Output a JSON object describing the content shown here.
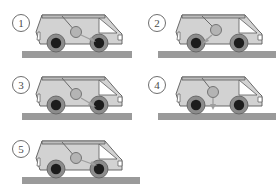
{
  "figure": {
    "background_color": "#ffffff",
    "colors": {
      "body_fill": "#d2d2d2",
      "body_stroke": "#5a5a5a",
      "roof_fill": "#bdbdbd",
      "window_fill": "#ffffff",
      "tire_fill": "#1c1c1c",
      "rim_fill": "#8c8c8c",
      "ground_fill": "#9a9a9a",
      "bob_fill": "#b4b4b4",
      "bob_stroke": "#6a6a6a",
      "string_stroke": "#6a6a6a",
      "arrow_stroke": "#9e9e9e",
      "label_text": "#4a4a4a",
      "label_border": "#6e6e6e"
    }
  },
  "panels": [
    {
      "id": "panel-1",
      "label": "1",
      "icon_name": "circled-number-1",
      "pendulum": {
        "pivot_x": 62,
        "pivot_y": 13,
        "bob_x": 76,
        "bob_y": 30,
        "bob_r": 5.5,
        "tilt": "backward"
      },
      "arrow": {
        "name": "acceleration-arrow-right-down",
        "from_x": 80,
        "from_y": 33,
        "to_x": 95,
        "to_y": 40,
        "direction": "down-right"
      }
    },
    {
      "id": "panel-2",
      "label": "2",
      "icon_name": "circled-number-2",
      "pendulum": {
        "pivot_x": 62,
        "pivot_y": 13,
        "bob_x": 76,
        "bob_y": 28,
        "bob_r": 5.5,
        "tilt": "backward"
      },
      "arrow": {
        "name": "acceleration-arrow-left-down",
        "from_x": 72,
        "from_y": 33,
        "to_x": 62,
        "to_y": 42,
        "direction": "down-left"
      }
    },
    {
      "id": "panel-3",
      "label": "3",
      "icon_name": "circled-number-3",
      "pendulum": {
        "pivot_x": 62,
        "pivot_y": 13,
        "bob_x": 76,
        "bob_y": 30,
        "bob_r": 5.5,
        "tilt": "backward"
      },
      "arrow": {
        "name": "acceleration-arrow-right-down",
        "from_x": 80,
        "from_y": 33,
        "to_x": 95,
        "to_y": 42,
        "direction": "down-right"
      }
    },
    {
      "id": "panel-4",
      "label": "4",
      "icon_name": "circled-number-4",
      "pendulum": {
        "pivot_x": 62,
        "pivot_y": 13,
        "bob_x": 73,
        "bob_y": 28,
        "bob_r": 5.5,
        "tilt": "backward"
      },
      "arrow": {
        "name": "acceleration-arrow-down",
        "from_x": 73,
        "from_y": 34,
        "to_x": 73,
        "to_y": 45,
        "direction": "down"
      }
    },
    {
      "id": "panel-5",
      "label": "5",
      "icon_name": "circled-number-5",
      "pendulum": {
        "pivot_x": 62,
        "pivot_y": 13,
        "bob_x": 76,
        "bob_y": 30,
        "bob_r": 5.5,
        "tilt": "backward"
      },
      "arrow": {
        "name": "acceleration-arrow-right-down",
        "from_x": 80,
        "from_y": 33,
        "to_x": 96,
        "to_y": 40,
        "direction": "down-right"
      }
    }
  ]
}
